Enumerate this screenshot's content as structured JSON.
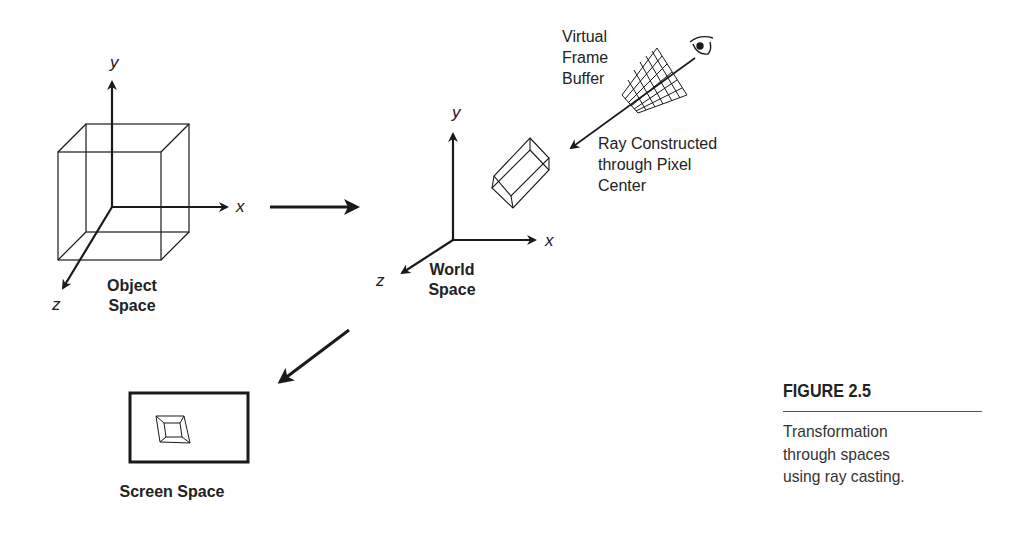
{
  "figure": {
    "number": "FIGURE 2.5",
    "caption_lines": [
      "Transformation",
      "through spaces",
      "using ray casting."
    ]
  },
  "object_space": {
    "label_line1": "Object",
    "label_line2": "Space",
    "axes": {
      "x": "x",
      "y": "y",
      "z": "z"
    }
  },
  "world_space": {
    "label_line1": "World",
    "label_line2": "Space",
    "axes": {
      "x": "x",
      "y": "y",
      "z": "z"
    }
  },
  "frame_buffer": {
    "label_lines": [
      "Virtual",
      "Frame",
      "Buffer"
    ]
  },
  "ray": {
    "label_lines": [
      "Ray Constructed",
      "through Pixel",
      "Center"
    ]
  },
  "screen_space": {
    "label": "Screen Space"
  },
  "icons": {
    "eye": "eye-icon"
  },
  "colors": {
    "stroke": "#1a1a1a",
    "background": "#ffffff"
  }
}
